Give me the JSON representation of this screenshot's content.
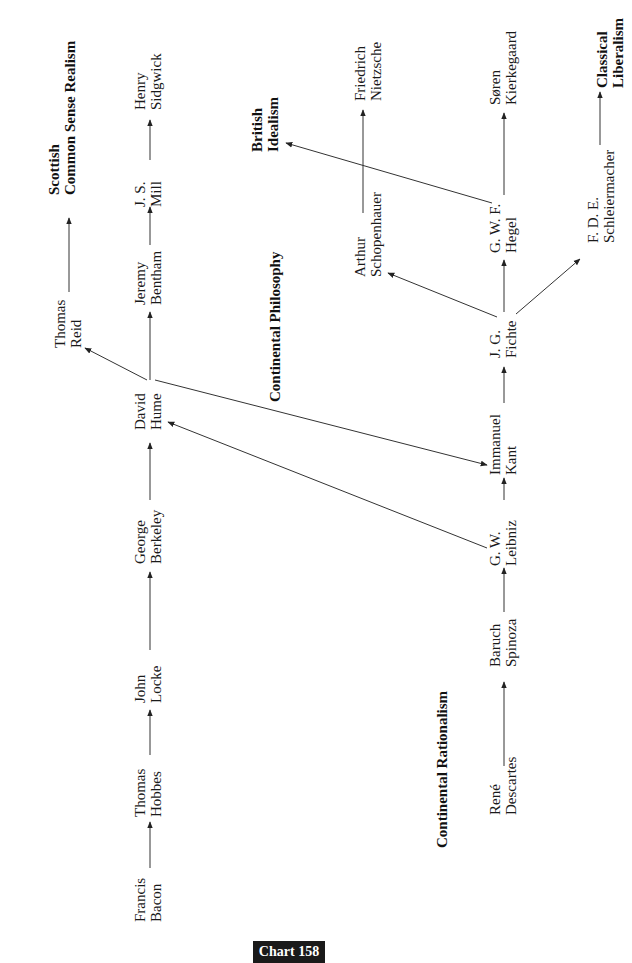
{
  "chart_label": "Chart 158",
  "orientation": "rotated 90 degrees counterclockwise (text reads bottom-to-top)",
  "schools": {
    "scottish": {
      "line1": "Scottish",
      "line2": "Common Sense Realism"
    },
    "british_idealism": {
      "line1": "British",
      "line2": "Idealism"
    },
    "continental_philosophy": {
      "line1": "Continental Philosophy"
    },
    "continental_rationalism": {
      "line1": "Continental Rationalism"
    },
    "classical_liberalism": {
      "line1": "Classical",
      "line2": "Liberalism"
    }
  },
  "philosophers": {
    "bacon": {
      "first": "Francis",
      "last": "Bacon"
    },
    "hobbes": {
      "first": "Thomas",
      "last": "Hobbes"
    },
    "locke": {
      "first": "John",
      "last": "Locke"
    },
    "berkeley": {
      "first": "George",
      "last": "Berkeley"
    },
    "hume": {
      "first": "David",
      "last": "Hume"
    },
    "bentham": {
      "first": "Jeremy",
      "last": "Bentham"
    },
    "mill": {
      "first": "J. S.",
      "last": "Mill"
    },
    "sidgwick": {
      "first": "Henry",
      "last": "Sidgwick"
    },
    "reid": {
      "first": "Thomas",
      "last": "Reid"
    },
    "descartes": {
      "first": "René",
      "last": "Descartes"
    },
    "spinoza": {
      "first": "Baruch",
      "last": "Spinoza"
    },
    "leibniz": {
      "first": "G. W.",
      "last": "Leibniz"
    },
    "kant": {
      "first": "Immanuel",
      "last": "Kant"
    },
    "fichte": {
      "first": "J. G.",
      "last": "Fichte"
    },
    "hegel": {
      "first": "G. W. F.",
      "last": "Hegel"
    },
    "kierkegaard": {
      "first": "Søren",
      "last": "Kierkegaard"
    },
    "schopenhauer": {
      "first": "Arthur",
      "last": "Schopenhauer"
    },
    "nietzsche": {
      "first": "Friedrich",
      "last": "Nietzsche"
    },
    "schleiermacher": {
      "first": "F. D. E.",
      "last": "Schleiermacher"
    }
  },
  "edges": [
    [
      "Francis Bacon",
      "Thomas Hobbes"
    ],
    [
      "Thomas Hobbes",
      "John Locke"
    ],
    [
      "John Locke",
      "George Berkeley"
    ],
    [
      "George Berkeley",
      "David Hume"
    ],
    [
      "David Hume",
      "Jeremy Bentham"
    ],
    [
      "Jeremy Bentham",
      "J. S. Mill"
    ],
    [
      "J. S. Mill",
      "Henry Sidgwick"
    ],
    [
      "David Hume",
      "Thomas Reid"
    ],
    [
      "Thomas Reid",
      "Scottish Common Sense Realism"
    ],
    [
      "David Hume",
      "Immanuel Kant"
    ],
    [
      "G. W. Leibniz",
      "David Hume"
    ],
    [
      "René Descartes",
      "Baruch Spinoza"
    ],
    [
      "Baruch Spinoza",
      "G. W. Leibniz"
    ],
    [
      "G. W. Leibniz",
      "Immanuel Kant"
    ],
    [
      "Immanuel Kant",
      "J. G. Fichte"
    ],
    [
      "J. G. Fichte",
      "G. W. F. Hegel"
    ],
    [
      "J. G. Fichte",
      "Arthur Schopenhauer"
    ],
    [
      "J. G. Fichte",
      "F. D. E. Schleiermacher"
    ],
    [
      "G. W. F. Hegel",
      "Søren Kierkegaard"
    ],
    [
      "G. W. F. Hegel",
      "British Idealism"
    ],
    [
      "Arthur Schopenhauer",
      "Friedrich Nietzsche"
    ],
    [
      "F. D. E. Schleiermacher",
      "Classical Liberalism"
    ]
  ]
}
